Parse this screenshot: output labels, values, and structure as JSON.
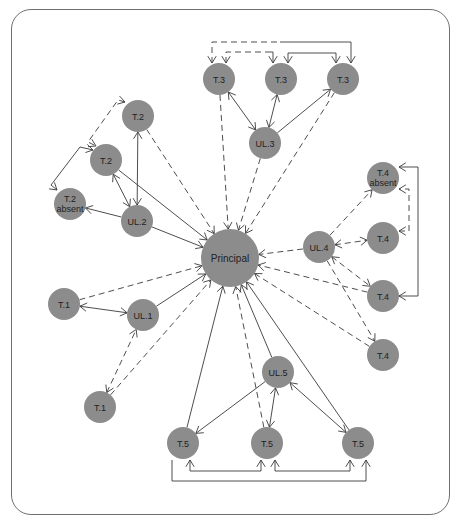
{
  "diagram": {
    "title": "",
    "colors": {
      "node_fill": "#8c8c8c",
      "line": "#3a3a3a",
      "frame": "#6f6f6f",
      "text": "#222222"
    },
    "nodes": [
      {
        "id": "principal",
        "label": "Principal",
        "x": 230,
        "y": 258,
        "r": 29
      },
      {
        "id": "t3a",
        "label": "T.3",
        "x": 219,
        "y": 79,
        "r": 16
      },
      {
        "id": "t3b",
        "label": "T.3",
        "x": 281,
        "y": 79,
        "r": 16
      },
      {
        "id": "t3c",
        "label": "T.3",
        "x": 343,
        "y": 79,
        "r": 16
      },
      {
        "id": "ul3",
        "label": "UL.3",
        "x": 265,
        "y": 143,
        "r": 16
      },
      {
        "id": "t2a",
        "label": "T.2",
        "x": 138,
        "y": 116,
        "r": 16
      },
      {
        "id": "t2b",
        "label": "T.2",
        "x": 106,
        "y": 160,
        "r": 16
      },
      {
        "id": "t2abs",
        "label": "T.2",
        "label2": "absent",
        "x": 70,
        "y": 204,
        "r": 16
      },
      {
        "id": "ul2",
        "label": "UL.2",
        "x": 137,
        "y": 221,
        "r": 16
      },
      {
        "id": "t4abs",
        "label": "T.4",
        "label2": "absent",
        "x": 383,
        "y": 178,
        "r": 16
      },
      {
        "id": "t4a",
        "label": "T.4",
        "x": 383,
        "y": 238,
        "r": 16
      },
      {
        "id": "ul4",
        "label": "UL.4",
        "x": 319,
        "y": 247,
        "r": 16
      },
      {
        "id": "t4b",
        "label": "T.4",
        "x": 383,
        "y": 296,
        "r": 16
      },
      {
        "id": "t4c",
        "label": "T.4",
        "x": 383,
        "y": 355,
        "r": 16
      },
      {
        "id": "t1a",
        "label": "T.1",
        "x": 64,
        "y": 304,
        "r": 16
      },
      {
        "id": "ul1",
        "label": "UL.1",
        "x": 143,
        "y": 315,
        "r": 16
      },
      {
        "id": "t1b",
        "label": "T.1",
        "x": 100,
        "y": 407,
        "r": 16
      },
      {
        "id": "ul5",
        "label": "UL.5",
        "x": 278,
        "y": 372,
        "r": 16
      },
      {
        "id": "t5a",
        "label": "T.5",
        "x": 183,
        "y": 443,
        "r": 16
      },
      {
        "id": "t5b",
        "label": "T.5",
        "x": 267,
        "y": 443,
        "r": 16
      },
      {
        "id": "t5c",
        "label": "T.5",
        "x": 358,
        "y": 443,
        "r": 16
      }
    ],
    "edges": [
      {
        "from": "t3a",
        "to": "principal",
        "style": "dashed",
        "arrow": "end"
      },
      {
        "from": "ul3",
        "to": "principal",
        "style": "dashed",
        "arrow": "end"
      },
      {
        "from": "t3c",
        "to": "principal",
        "style": "dashed",
        "arrow": "end"
      },
      {
        "from": "t3a",
        "to": "ul3",
        "style": "solid",
        "arrow": "both"
      },
      {
        "from": "t3b",
        "to": "ul3",
        "style": "solid",
        "arrow": "both"
      },
      {
        "from": "ul3",
        "to": "t3c",
        "style": "solid",
        "arrow": "end"
      },
      {
        "from": "t2a",
        "to": "principal",
        "style": "dashed",
        "arrow": "end"
      },
      {
        "from": "t2b",
        "to": "principal",
        "style": "solid",
        "arrow": "end"
      },
      {
        "from": "ul2",
        "to": "principal",
        "style": "solid",
        "arrow": "end"
      },
      {
        "from": "ul2",
        "to": "t2a",
        "style": "solid",
        "arrow": "both"
      },
      {
        "from": "ul2",
        "to": "t2b",
        "style": "solid",
        "arrow": "both"
      },
      {
        "from": "ul2",
        "to": "t2abs",
        "style": "solid",
        "arrow": "end"
      },
      {
        "from": "ul4",
        "to": "principal",
        "style": "dashed",
        "arrow": "end"
      },
      {
        "from": "ul4",
        "to": "t4abs",
        "style": "dashed",
        "arrow": "end"
      },
      {
        "from": "ul4",
        "to": "t4a",
        "style": "dashed",
        "arrow": "both"
      },
      {
        "from": "ul4",
        "to": "t4b",
        "style": "dashed",
        "arrow": "both"
      },
      {
        "from": "ul4",
        "to": "t4c",
        "style": "dashed",
        "arrow": "end"
      },
      {
        "from": "t4b",
        "to": "principal",
        "style": "dashed",
        "arrow": "end"
      },
      {
        "from": "t4c",
        "to": "principal",
        "style": "dashed",
        "arrow": "end"
      },
      {
        "from": "t1a",
        "to": "principal",
        "style": "dashed",
        "arrow": "end"
      },
      {
        "from": "t1a",
        "to": "ul1",
        "style": "solid",
        "arrow": "both"
      },
      {
        "from": "ul1",
        "to": "principal",
        "style": "solid",
        "arrow": "end"
      },
      {
        "from": "t1b",
        "to": "ul1",
        "style": "dashed",
        "arrow": "both"
      },
      {
        "from": "t1b",
        "to": "principal",
        "style": "dashed",
        "arrow": "end"
      },
      {
        "from": "t5a",
        "to": "principal",
        "style": "solid",
        "arrow": "end"
      },
      {
        "from": "t5b",
        "to": "principal",
        "style": "dashed",
        "arrow": "end"
      },
      {
        "from": "t5c",
        "to": "principal",
        "style": "solid",
        "arrow": "end"
      },
      {
        "from": "ul5",
        "to": "principal",
        "style": "solid",
        "arrow": "end"
      },
      {
        "from": "ul5",
        "to": "t5a",
        "style": "solid",
        "arrow": "end"
      },
      {
        "from": "ul5",
        "to": "t5b",
        "style": "solid",
        "arrow": "both"
      },
      {
        "from": "ul5",
        "to": "t5c",
        "style": "solid",
        "arrow": "both"
      }
    ],
    "connectors": [
      {
        "name": "t3-dashed-outer",
        "style": "dashed",
        "points": [
          [
            212,
            63
          ],
          [
            212,
            42
          ],
          [
            280,
            42
          ]
        ]
      },
      {
        "name": "t3-outer-solid",
        "style": "solid",
        "points": [
          [
            280,
            42
          ],
          [
            351,
            42
          ],
          [
            351,
            63
          ]
        ]
      },
      {
        "name": "t3-dashed-inner",
        "style": "dashed",
        "points": [
          [
            226,
            63
          ],
          [
            226,
            52
          ],
          [
            270,
            52
          ]
        ]
      },
      {
        "name": "t3-inner-solid",
        "style": "solid",
        "points": [
          [
            270,
            52
          ],
          [
            273,
            52
          ],
          [
            273,
            63
          ]
        ]
      },
      {
        "name": "t3b-t3c-solid",
        "style": "solid",
        "points": [
          [
            288,
            63
          ],
          [
            288,
            53
          ],
          [
            336,
            53
          ],
          [
            336,
            63
          ]
        ]
      },
      {
        "name": "t2a-t2b-dashed",
        "style": "dashed",
        "points": [
          [
            125,
            102
          ],
          [
            118,
            100
          ],
          [
            88,
            142
          ],
          [
            96,
            146
          ]
        ]
      },
      {
        "name": "t2b-t2abs-solid",
        "style": "solid",
        "points": [
          [
            93,
            150
          ],
          [
            80,
            147
          ],
          [
            51,
            185
          ],
          [
            57,
            190
          ]
        ]
      },
      {
        "name": "t4a-t4abs-dashed",
        "style": "dashed",
        "points": [
          [
            399,
            231
          ],
          [
            409,
            231
          ],
          [
            409,
            189
          ],
          [
            399,
            189
          ]
        ]
      },
      {
        "name": "t4b-t4abs-solid",
        "style": "solid",
        "points": [
          [
            399,
            296
          ],
          [
            418,
            296
          ],
          [
            418,
            167
          ],
          [
            399,
            167
          ]
        ]
      },
      {
        "name": "t5-inner",
        "style": "solid",
        "points": [
          [
            190,
            460
          ],
          [
            190,
            471
          ],
          [
            261,
            471
          ],
          [
            261,
            460
          ]
        ]
      },
      {
        "name": "t5-inner2",
        "style": "solid",
        "points": [
          [
            275,
            460
          ],
          [
            275,
            471
          ],
          [
            350,
            471
          ],
          [
            350,
            460
          ]
        ]
      },
      {
        "name": "t5-outer",
        "style": "solid",
        "points": [
          [
            172,
            460
          ],
          [
            172,
            481
          ],
          [
            366,
            481
          ],
          [
            366,
            460
          ]
        ]
      }
    ]
  }
}
